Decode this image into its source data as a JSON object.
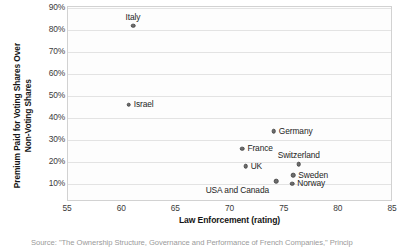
{
  "chart_data": {
    "type": "scatter",
    "title": "",
    "xlabel": "Law Enforcement (rating)",
    "ylabel": "Premium Paid for Voting Shares Over Non-Voting Shares",
    "ylabel_lines": [
      "Premium Paid for Voting Shares Over",
      "Non-Voting Shares"
    ],
    "xlim": [
      55,
      85
    ],
    "ylim": [
      0.05,
      0.93
    ],
    "xticks": [
      55,
      60,
      65,
      70,
      75,
      80,
      85
    ],
    "xtick_labels": [
      "55",
      "60",
      "65",
      "70",
      "75",
      "80",
      "85"
    ],
    "yticks": [
      90,
      80,
      70,
      60,
      50,
      40,
      30,
      20,
      10
    ],
    "ytick_labels": [
      "90%",
      "80%",
      "70%",
      "60%",
      "50%",
      "40%",
      "30%",
      "20%",
      "10%"
    ],
    "grid": "horizontal",
    "legend": "none",
    "marker_color": "#6e6e6e",
    "points": [
      {
        "label": "Italy",
        "x": 61.0,
        "y": 82.0,
        "label_pos": "above"
      },
      {
        "label": "Israel",
        "x": 60.6,
        "y": 46.0,
        "label_pos": "right"
      },
      {
        "label": "Germany",
        "x": 74.0,
        "y": 34.0,
        "label_pos": "right"
      },
      {
        "label": "France",
        "x": 71.1,
        "y": 26.0,
        "label_pos": "right"
      },
      {
        "label": "Switzerland",
        "x": 76.3,
        "y": 19.0,
        "label_pos": "above"
      },
      {
        "label": "UK",
        "x": 71.4,
        "y": 18.0,
        "label_pos": "right"
      },
      {
        "label": "Sweden",
        "x": 75.8,
        "y": 14.0,
        "label_pos": "right"
      },
      {
        "label": "USA and Canada",
        "x": 74.2,
        "y": 11.4,
        "label_pos": "below-left"
      },
      {
        "label": "Norway",
        "x": 75.7,
        "y": 10.2,
        "label_pos": "right"
      }
    ]
  },
  "source": {
    "text": "Source: \"The Ownership Structure, Governance and Performance of French Companies,\" Princip"
  }
}
